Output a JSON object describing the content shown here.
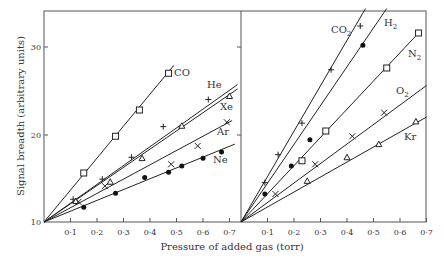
{
  "chart_data": {
    "type": "scatter",
    "title": "",
    "xlabel": "Pressure of added gas (torr)",
    "ylabel": "Signal breadth (arbitrary units)",
    "ylim": [
      10,
      35
    ],
    "y_ticks": [
      "10",
      "20",
      "30"
    ],
    "x_tick_labels": [
      "0·1",
      "0·2",
      "0·3",
      "0·4",
      "0·5",
      "0·6",
      "0·7"
    ],
    "grid": false,
    "panels": [
      {
        "name": "left",
        "xlim": [
          0,
          0.74
        ],
        "series": [
          {
            "name": "CO",
            "marker": "square-open",
            "x": [
              0.15,
              0.27,
              0.36,
              0.47
            ],
            "y": [
              15.6,
              19.8,
              22.8,
              27.0
            ],
            "fit_end": [
              0.49,
              27.9
            ]
          },
          {
            "name": "He",
            "marker": "plus",
            "x": [
              0.11,
              0.22,
              0.33,
              0.45,
              0.62
            ],
            "y": [
              12.6,
              14.9,
              17.4,
              20.9,
              24.0
            ],
            "fit_end": [
              0.73,
              25.7
            ]
          },
          {
            "name": "Xe",
            "marker": "triangle-open",
            "x": [
              0.12,
              0.25,
              0.37,
              0.52,
              0.7
            ],
            "y": [
              12.4,
              14.6,
              17.3,
              21.0,
              24.4
            ],
            "fit_end": [
              0.73,
              25.2
            ]
          },
          {
            "name": "Ar",
            "marker": "cross",
            "x": [
              0.13,
              0.23,
              0.48,
              0.58,
              0.69
            ],
            "y": [
              12.3,
              14.1,
              16.6,
              18.7,
              21.4
            ],
            "fit_end": [
              0.71,
              21.6
            ]
          },
          {
            "name": "Ne",
            "marker": "filled-circle",
            "x": [
              0.15,
              0.27,
              0.38,
              0.47,
              0.52,
              0.6,
              0.67
            ],
            "y": [
              11.7,
              13.3,
              15.1,
              15.7,
              16.4,
              17.3,
              18.0
            ],
            "fit_end": [
              0.72,
              18.9
            ]
          }
        ]
      },
      {
        "name": "right",
        "xlim": [
          0,
          0.7
        ],
        "series": [
          {
            "name": "CO2",
            "label": "CO₂",
            "marker": "plus",
            "x": [
              0.09,
              0.14,
              0.23,
              0.34,
              0.45
            ],
            "y": [
              14.5,
              17.7,
              21.3,
              27.4,
              32.4
            ],
            "fit_end": [
              0.47,
              34.4
            ]
          },
          {
            "name": "H2",
            "label": "H₂",
            "marker": "filled-circle",
            "x": [
              0.09,
              0.19,
              0.26,
              0.46
            ],
            "y": [
              13.2,
              16.4,
              19.4,
              30.2
            ],
            "fit_end": [
              0.55,
              34.4
            ]
          },
          {
            "name": "N2",
            "label": "N₂",
            "marker": "square-open",
            "x": [
              0.23,
              0.32,
              0.55,
              0.67
            ],
            "y": [
              17.0,
              20.4,
              27.6,
              31.6
            ],
            "fit_end": [
              0.67,
              31.6
            ]
          },
          {
            "name": "O2",
            "label": "O₂",
            "marker": "cross",
            "x": [
              0.13,
              0.28,
              0.42,
              0.54
            ],
            "y": [
              13.2,
              16.6,
              19.8,
              22.5
            ],
            "fit_end": [
              0.7,
              25.6
            ]
          },
          {
            "name": "Kr",
            "label": "Kr",
            "marker": "triangle-open",
            "x": [
              0.25,
              0.4,
              0.52,
              0.66
            ],
            "y": [
              14.7,
              17.4,
              18.9,
              21.5
            ],
            "fit_end": [
              0.7,
              22.0
            ]
          }
        ]
      }
    ]
  },
  "labels": {
    "ylabel": "Signal breadth (arbitrary units)",
    "xlabel": "Pressure of added gas (torr)",
    "y10": "10",
    "y20": "20",
    "y30": "30",
    "CO": "CO",
    "He": "He",
    "Xe": "Xe",
    "Ar": "Ar",
    "Ne": "Ne",
    "CO2": "CO",
    "H2": "H",
    "N2": "N",
    "O2": "O",
    "Kr": "Kr",
    "sub2": "2",
    "xticks": [
      "0·1",
      "0·2",
      "0·3",
      "0·4",
      "0·5",
      "0·6",
      "0·7"
    ]
  }
}
